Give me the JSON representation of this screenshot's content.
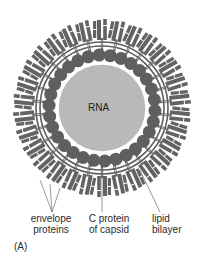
{
  "diagram": {
    "center": {
      "x": 102,
      "y": 108
    },
    "core": {
      "label": "RNA",
      "radius": 44,
      "color": "#b9b9b9"
    },
    "capsid": {
      "count": 30,
      "ring_radius": 53,
      "particle_radius": 6.5,
      "color": "#5f5f5f"
    },
    "bilayer": {
      "inner_radius": 62,
      "outer_radius": 66,
      "color": "#5f5f5f"
    },
    "envelope_spikes": {
      "count": 30,
      "inner_radius": 58,
      "outer_radius": 88,
      "color": "#636363"
    },
    "labels": {
      "envelope": [
        "envelope",
        "proteins"
      ],
      "capsid": [
        "C protein",
        "of capsid"
      ],
      "lipid": [
        "lipid",
        "bilayer"
      ],
      "panel": "(A)"
    },
    "colors": {
      "background": "#ffffff",
      "dark": "#5f5f5f",
      "core": "#b9b9b9",
      "leader": "#555555"
    }
  }
}
